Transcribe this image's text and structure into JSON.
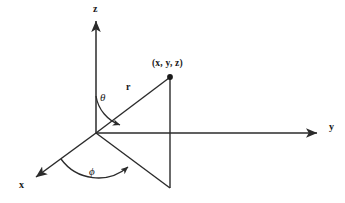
{
  "figure": {
    "kind": "spherical-coordinate-axes-diagram",
    "background_color": "#ffffff",
    "stroke_color": "#2b2b2b",
    "text_color": "#1a1a1a"
  },
  "axes": [
    {
      "name": "z-axis",
      "label": "z",
      "arrow": true
    },
    {
      "name": "y-axis",
      "label": "y",
      "arrow": true
    },
    {
      "name": "x-axis",
      "label": "x",
      "arrow": true
    }
  ],
  "labels": {
    "z": "z",
    "y": "y",
    "x": "x",
    "r": "r",
    "theta": "θ",
    "phi": "ϕ",
    "point": "(x, y, z)"
  },
  "geometry": {
    "origin": {
      "x": 96,
      "y": 133
    },
    "z_tip": {
      "x": 96,
      "y": 18
    },
    "y_tip": {
      "x": 320,
      "y": 133
    },
    "x_tip": {
      "x": 33,
      "y": 179
    },
    "point": {
      "x": 170,
      "y": 77
    },
    "projection_vertex": {
      "x": 170,
      "y": 188
    }
  },
  "segments": [
    {
      "name": "radius-line",
      "label": "r",
      "from": "origin",
      "to": "point"
    },
    {
      "name": "vertical-drop-line",
      "label": "",
      "from": "point",
      "to": "projection_vertex"
    },
    {
      "name": "projection-line",
      "label": "",
      "from": "origin",
      "to": "projection_vertex"
    }
  ],
  "angles": [
    {
      "name": "polar-angle-arc",
      "label": "θ",
      "between": [
        "z-axis",
        "radius-line"
      ],
      "arrowhead": true
    },
    {
      "name": "azimuthal-angle-arc",
      "label": "ϕ",
      "between": [
        "x-axis",
        "projection-line"
      ],
      "arrowhead": true
    }
  ]
}
